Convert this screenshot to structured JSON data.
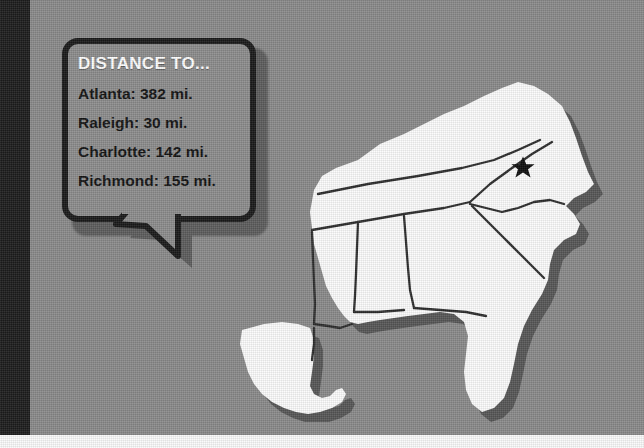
{
  "canvas": {
    "width": 644,
    "height": 448,
    "background_color": "#8a8a8a",
    "left_band_color": "#1c1c1c",
    "bottom_strip_color": "#fbfbfb"
  },
  "callout": {
    "title": "DISTANCE TO...",
    "title_color": "#ffffff",
    "text_color": "#111111",
    "border_color": "#191919",
    "fill_color": "#8c8c8c",
    "lines": [
      "Atlanta: 382 mi.",
      "Raleigh: 30 mi.",
      "Charlotte: 142 mi.",
      "Richmond: 155 mi."
    ],
    "entries": [
      {
        "city": "Atlanta",
        "distance": 382,
        "unit": "mi."
      },
      {
        "city": "Raleigh",
        "distance": 30,
        "unit": "mi."
      },
      {
        "city": "Charlotte",
        "distance": 142,
        "unit": "mi."
      },
      {
        "city": "Richmond",
        "distance": 155,
        "unit": "mi."
      }
    ]
  },
  "map": {
    "region": "Southeastern United States",
    "land_color": "#fcfcfc",
    "border_color": "#2b2b2b",
    "shadow_color": "#565656",
    "marker": {
      "type": "star",
      "label": "location-star",
      "color": "#0d0d0d",
      "state": "North Carolina"
    },
    "states": [
      "Kentucky",
      "Tennessee",
      "North Carolina",
      "South Carolina",
      "Georgia",
      "Florida",
      "Alabama",
      "Mississippi",
      "Louisiana"
    ]
  }
}
